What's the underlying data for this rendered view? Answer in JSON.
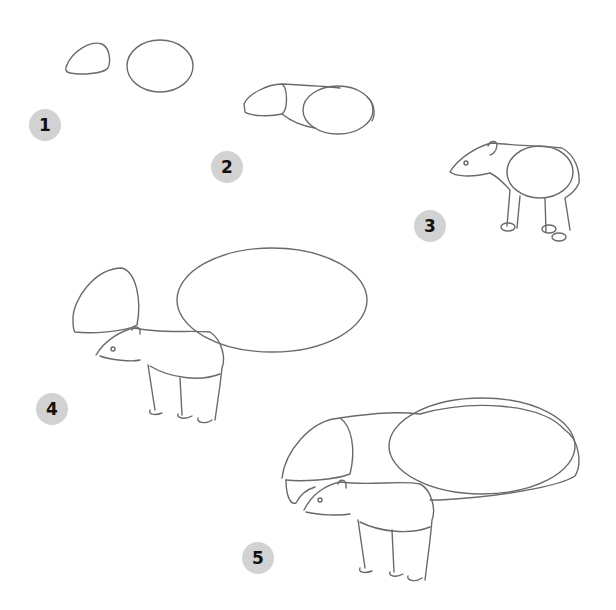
{
  "steps": [
    {
      "label": "1",
      "description": "Head and body circles"
    },
    {
      "label": "2",
      "description": "Connect head and body, add tail"
    },
    {
      "label": "3",
      "description": "Tapir calf outline with legs"
    },
    {
      "label": "4",
      "description": "Adult head and body shapes above calf"
    },
    {
      "label": "5",
      "description": "Adult tapir outline behind calf"
    }
  ],
  "colors": {
    "badge": "#d2d2d2",
    "line": "#6a6a6a",
    "background": "#ffffff"
  }
}
